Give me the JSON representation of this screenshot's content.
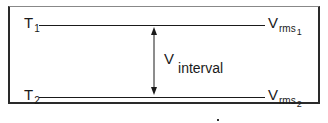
{
  "diagram": {
    "top_level": {
      "label": "T",
      "subscript": "1",
      "right_label": "V",
      "right_subscript": "rms",
      "right_subsubscript": "1"
    },
    "bottom_level": {
      "label": "T",
      "subscript": "2",
      "right_label": "V",
      "right_subscript": "rms",
      "right_subsubscript": "2"
    },
    "interval": {
      "label": "V",
      "subscript": "interval"
    },
    "colors": {
      "line": "#1a1a1a",
      "border": "#2a2a2a",
      "background": "#ffffff"
    }
  }
}
